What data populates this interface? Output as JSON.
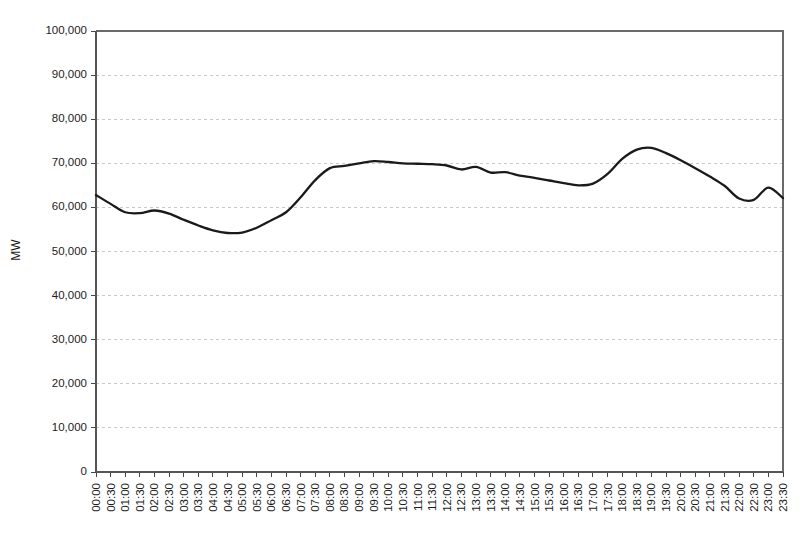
{
  "chart_data": {
    "type": "line",
    "title": "",
    "subtitle": "",
    "xlabel": "",
    "ylabel": "MW",
    "ylim": [
      0,
      100000
    ],
    "ytick_labels": [
      "100,000",
      "90,000",
      "80,000",
      "70,000",
      "60,000",
      "50,000",
      "40,000",
      "30,000",
      "20,000",
      "10,000",
      "0"
    ],
    "ytick_values": [
      100000,
      90000,
      80000,
      70000,
      60000,
      50000,
      40000,
      30000,
      20000,
      10000,
      0
    ],
    "grid": true,
    "grid_axis": "y",
    "legend": false,
    "legend_position": "none",
    "line_color": "#1a1a1a",
    "grid_color": "#c8c8d0",
    "axis_color": "#555555",
    "categories": [
      "00:00",
      "00:30",
      "01:00",
      "01:30",
      "02:00",
      "02:30",
      "03:00",
      "03:30",
      "04:00",
      "04:30",
      "05:00",
      "05:30",
      "06:00",
      "06:30",
      "07:00",
      "07:30",
      "08:00",
      "08:30",
      "09:00",
      "09:30",
      "10:00",
      "10:30",
      "11:00",
      "11:30",
      "12:00",
      "12:30",
      "13:00",
      "13:30",
      "14:00",
      "14:30",
      "15:00",
      "15:30",
      "16:00",
      "16:30",
      "17:00",
      "17:30",
      "18:00",
      "18:30",
      "19:00",
      "19:30",
      "20:00",
      "20:30",
      "21:00",
      "21:30",
      "22:00",
      "22:30",
      "23:00",
      "23:30"
    ],
    "values": [
      62800,
      60800,
      58900,
      58700,
      59300,
      58600,
      57200,
      55900,
      54800,
      54200,
      54300,
      55400,
      57100,
      58900,
      62300,
      66200,
      68900,
      69400,
      70000,
      70500,
      70300,
      70000,
      69900,
      69800,
      69500,
      68600,
      69200,
      67900,
      68000,
      67200,
      66700,
      66100,
      65500,
      65000,
      65400,
      67600,
      71000,
      73100,
      73500,
      72300,
      70700,
      68900,
      67000,
      64900,
      62000,
      61700,
      64500,
      62100
    ],
    "series": [
      {
        "name": "Demand",
        "unit": "MW",
        "values": [
          62800,
          60800,
          58900,
          58700,
          59300,
          58600,
          57200,
          55900,
          54800,
          54200,
          54300,
          55400,
          57100,
          58900,
          62300,
          66200,
          68900,
          69400,
          70000,
          70500,
          70300,
          70000,
          69900,
          69800,
          69500,
          68600,
          69200,
          67900,
          68000,
          67200,
          66700,
          66100,
          65500,
          65000,
          65400,
          67600,
          71000,
          73100,
          73500,
          72300,
          70700,
          68900,
          67000,
          64900,
          62000,
          61700,
          64500,
          62100
        ]
      }
    ],
    "annotations": []
  }
}
